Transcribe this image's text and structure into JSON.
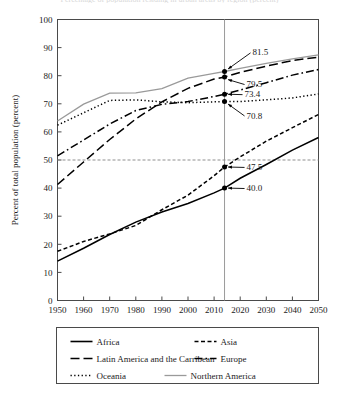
{
  "page": {
    "cut_off_title": "Percentage of population residing in urban areas by region (percent)"
  },
  "chart_data": {
    "type": "line",
    "title": "",
    "xlabel": "",
    "ylabel": "Percent of total population (percent)",
    "xlim": [
      1950,
      2050
    ],
    "ylim": [
      0,
      100
    ],
    "xticks": [
      1950,
      1960,
      1970,
      1980,
      1990,
      2000,
      2010,
      2020,
      2030,
      2040,
      2050
    ],
    "yticks": [
      0,
      10,
      20,
      30,
      40,
      50,
      60,
      70,
      80,
      90,
      100
    ],
    "grid": false,
    "legend_position": "bottom",
    "x": [
      1950,
      1960,
      1970,
      1980,
      1990,
      2000,
      2010,
      2014,
      2020,
      2030,
      2040,
      2050
    ],
    "series": [
      {
        "name": "Africa",
        "style": "solid",
        "color": "#000000",
        "values": [
          14.0,
          18.6,
          23.5,
          27.9,
          31.5,
          34.5,
          38.3,
          40.0,
          43.5,
          48.4,
          53.5,
          58.0
        ]
      },
      {
        "name": "Asia",
        "style": "short-dash",
        "color": "#000000",
        "values": [
          17.5,
          21.0,
          23.7,
          26.7,
          32.3,
          37.5,
          44.4,
          47.5,
          51.1,
          56.7,
          61.5,
          66.2
        ]
      },
      {
        "name": "Latin America and the Carribean",
        "style": "long-dash",
        "color": "#000000",
        "values": [
          41.3,
          49.3,
          57.3,
          64.6,
          70.7,
          75.5,
          78.8,
          79.5,
          81.2,
          83.4,
          85.4,
          86.6
        ]
      },
      {
        "name": "Europe",
        "style": "dash-dot",
        "color": "#000000",
        "values": [
          51.5,
          57.1,
          62.8,
          67.6,
          69.8,
          70.8,
          72.6,
          73.4,
          74.9,
          77.5,
          80.2,
          82.2
        ]
      },
      {
        "name": "Oceania",
        "style": "dotted",
        "color": "#000000",
        "values": [
          62.4,
          66.8,
          71.2,
          71.4,
          70.7,
          70.4,
          70.7,
          70.8,
          70.8,
          71.4,
          72.1,
          73.5
        ]
      },
      {
        "name": "Northern America",
        "style": "solid",
        "color": "#9a9a9a",
        "values": [
          63.9,
          69.9,
          73.8,
          73.9,
          75.4,
          79.1,
          80.8,
          81.5,
          82.6,
          84.4,
          86.0,
          87.4
        ]
      }
    ],
    "reference_lines": {
      "vertical_x": 2014,
      "horizontal_y": 50
    },
    "annotations": [
      {
        "label": "81.5",
        "x": 2014,
        "y": 81.5,
        "series": "Northern America"
      },
      {
        "label": "79.5",
        "x": 2014,
        "y": 79.5,
        "series": "Latin America and the Carribean"
      },
      {
        "label": "73.4",
        "x": 2014,
        "y": 73.4,
        "series": "Europe"
      },
      {
        "label": "70.8",
        "x": 2014,
        "y": 70.8,
        "series": "Oceania"
      },
      {
        "label": "47.5",
        "x": 2014,
        "y": 47.5,
        "series": "Asia"
      },
      {
        "label": "40.0",
        "x": 2014,
        "y": 40.0,
        "series": "Africa"
      }
    ]
  },
  "legend": {
    "rows": [
      [
        "Africa",
        "Asia"
      ],
      [
        "Latin America and the Carribean",
        "Europe"
      ],
      [
        "Oceania",
        "Northern America"
      ]
    ]
  }
}
